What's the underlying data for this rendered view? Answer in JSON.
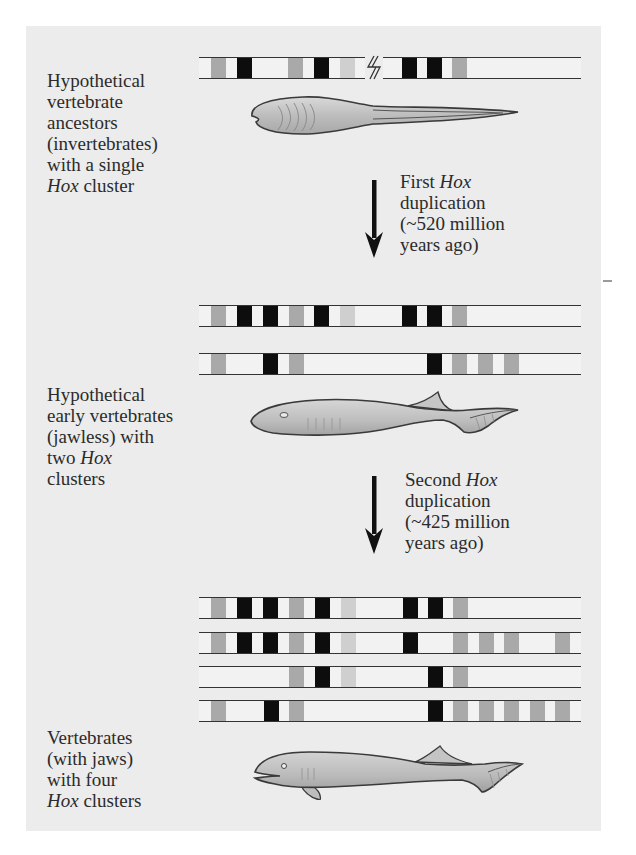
{
  "colors": {
    "panel_background": "#ececec",
    "page_background": "#ffffff",
    "gene_black": "#0d0d0d",
    "gene_gray": "#a9a9a9",
    "gene_light": "#cfcfcf",
    "cluster_line": "#333333"
  },
  "stages": [
    {
      "id": "ancestor",
      "label_lines": [
        "Hypothetical",
        "vertebrate",
        "ancestors",
        "(invertebrates)",
        "with a single",
        "Hox cluster"
      ],
      "italic_word": "Hox",
      "line1": "Hypothetical",
      "line2": "vertebrate",
      "line3": "ancestors",
      "line4": "(invertebrates)",
      "line5": "with a single",
      "line6_italic": "Hox",
      "line6_rest": " cluster",
      "organism_icon": "amphioxus-like-invertebrate-icon",
      "cluster_count": 1
    },
    {
      "id": "jawless",
      "line1": "Hypothetical",
      "line2": "early vertebrates",
      "line3": "(jawless) with",
      "line4_pre": "two ",
      "line4_italic": "Hox",
      "line5": "clusters",
      "organism_icon": "jawless-fish-icon",
      "cluster_count": 2
    },
    {
      "id": "jawed",
      "line1": "Vertebrates",
      "line2": "(with jaws)",
      "line3": "with four",
      "line4_italic": "Hox",
      "line4_rest": " clusters",
      "organism_icon": "jawed-fish-icon",
      "cluster_count": 4
    }
  ],
  "duplications": [
    {
      "line1_pre": "First ",
      "line1_italic": "Hox",
      "line2": "duplication",
      "line3": "(~520 million",
      "line4": "years ago)",
      "icon": "down-arrow-icon"
    },
    {
      "line1_pre": "Second ",
      "line1_italic": "Hox",
      "line2": "duplication",
      "line3": "(~425 million",
      "line4": "years ago)",
      "icon": "down-arrow-icon"
    }
  ],
  "clusters": {
    "ancestor": [
      {
        "genes": [
          [
            "gray",
            211
          ],
          [
            "black",
            237
          ],
          [
            "gray",
            288
          ],
          [
            "black",
            314
          ],
          [
            "light",
            340
          ],
          [
            "black",
            402
          ],
          [
            "black",
            427
          ],
          [
            "gray",
            452
          ]
        ],
        "break_at": 365
      }
    ],
    "two_cluster": [
      {
        "genes": [
          [
            "gray",
            211
          ],
          [
            "black",
            237
          ],
          [
            "black",
            263
          ],
          [
            "gray",
            289
          ],
          [
            "black",
            314
          ],
          [
            "light",
            340
          ],
          [
            "black",
            402
          ],
          [
            "black",
            427
          ],
          [
            "gray",
            452
          ]
        ]
      },
      {
        "genes": [
          [
            "gray",
            211
          ],
          [
            "black",
            263
          ],
          [
            "gray",
            289
          ],
          [
            "black",
            427
          ],
          [
            "gray",
            452
          ],
          [
            "gray",
            478
          ],
          [
            "gray",
            504
          ]
        ]
      }
    ],
    "four_cluster": [
      {
        "genes": [
          [
            "gray",
            211
          ],
          [
            "black",
            237
          ],
          [
            "black",
            263
          ],
          [
            "gray",
            289
          ],
          [
            "black",
            315
          ],
          [
            "light",
            341
          ],
          [
            "black",
            403
          ],
          [
            "black",
            428
          ],
          [
            "gray",
            453
          ]
        ]
      },
      {
        "genes": [
          [
            "gray",
            211
          ],
          [
            "black",
            237
          ],
          [
            "black",
            263
          ],
          [
            "gray",
            289
          ],
          [
            "black",
            315
          ],
          [
            "light",
            341
          ],
          [
            "black",
            403
          ],
          [
            "gray",
            453
          ],
          [
            "gray",
            479
          ],
          [
            "gray",
            504
          ],
          [
            "gray",
            555
          ]
        ]
      },
      {
        "genes": [
          [
            "gray",
            289
          ],
          [
            "black",
            315
          ],
          [
            "light",
            341
          ],
          [
            "black",
            428
          ],
          [
            "gray",
            453
          ]
        ]
      },
      {
        "genes": [
          [
            "gray",
            211
          ],
          [
            "black",
            264
          ],
          [
            "gray",
            289
          ],
          [
            "black",
            428
          ],
          [
            "gray",
            453
          ],
          [
            "gray",
            479
          ],
          [
            "gray",
            504
          ],
          [
            "gray",
            530
          ],
          [
            "gray",
            555
          ]
        ]
      }
    ]
  }
}
